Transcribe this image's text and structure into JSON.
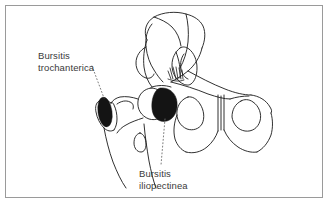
{
  "figure": {
    "type": "anatomical-line-drawing",
    "frame": {
      "border_color": "#9a9a9a",
      "background_color": "#ffffff"
    },
    "ink_color": "#1a1a1a",
    "marker_fill_color": "#141414",
    "text_color": "#3a3a3a"
  },
  "labels": [
    {
      "name": "bursitis-trochanterica",
      "line1": "Bursitis",
      "line2": "trochanterica",
      "leader": "dotted",
      "points_to": "greater-trochanter-bursa"
    },
    {
      "name": "bursitis-iliopectinea",
      "line1": "Bursitis",
      "line2": "iliopectinea",
      "leader": "dotted",
      "points_to": "iliopectineal-bursa"
    }
  ],
  "markers": [
    {
      "name": "trochanteric-bursa-marker",
      "shape": "ellipse",
      "cx": 105,
      "cy": 112,
      "rx": 7,
      "ry": 15,
      "rotation": -8
    },
    {
      "name": "iliopectineal-bursa-marker",
      "shape": "blob",
      "cx": 164,
      "cy": 104,
      "rx": 11,
      "ry": 16,
      "rotation": -12
    }
  ],
  "anatomy_parts": [
    "ilium",
    "iliac-crest",
    "sacrum",
    "acetabulum",
    "femoral-head",
    "femoral-neck",
    "greater-trochanter",
    "lesser-trochanter",
    "femoral-shaft",
    "pubic-symphysis",
    "obturator-foramen-left",
    "obturator-foramen-right",
    "ischium",
    "superior-pubic-ramus"
  ]
}
